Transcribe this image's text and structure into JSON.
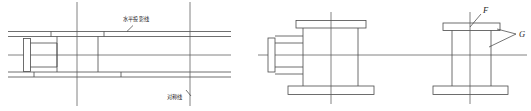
{
  "drawing": {
    "title": "Three-view engineering drawing of flanged body",
    "background_color": "#ffffff",
    "line_color": "#4a4a4a",
    "centerline_color": "#5a5a5a",
    "annotations": {
      "horizontal_projection_line": "水平投影线",
      "symmetry_line": "对称线",
      "label_f": "F",
      "label_g": "G"
    },
    "views": [
      {
        "name": "left-view",
        "kind": "longitudinal-section",
        "labels": [
          "水平投影线",
          "对称线"
        ]
      },
      {
        "name": "middle-view",
        "kind": "front-view",
        "labels": []
      },
      {
        "name": "right-view",
        "kind": "side-view",
        "labels": [
          "F",
          "G"
        ]
      }
    ]
  }
}
